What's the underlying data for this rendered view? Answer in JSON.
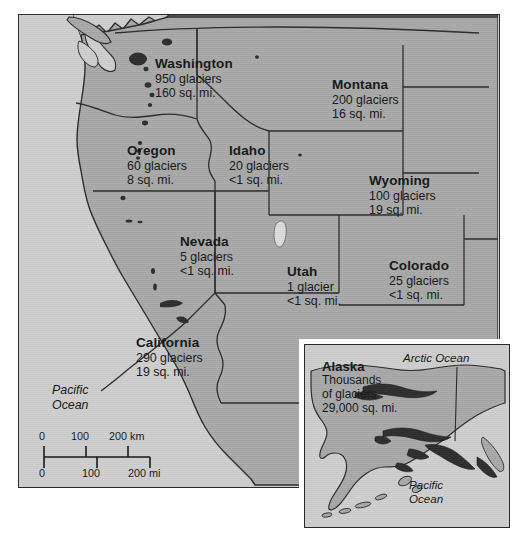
{
  "map": {
    "title": "Glaciers of the Western United States and Alaska",
    "colors": {
      "ocean": "#cfcfcf",
      "land": "#a9a9a9",
      "border": "#2b2b2b",
      "glacier": "#2e2e2e",
      "text": "#1a1a1a",
      "page": "#ffffff"
    },
    "states": [
      {
        "id": "washington",
        "name": "Washington",
        "glaciers_line": "950 glaciers",
        "area_line": "160 sq. mi.",
        "glacier_count": 950,
        "area_sq_mi": 160,
        "label_x": 136,
        "label_y": 41
      },
      {
        "id": "montana",
        "name": "Montana",
        "glaciers_line": "200 glaciers",
        "area_line": "16 sq. mi.",
        "glacier_count": 200,
        "area_sq_mi": 16,
        "label_x": 313,
        "label_y": 62
      },
      {
        "id": "oregon",
        "name": "Oregon",
        "glaciers_line": "60 glaciers",
        "area_line": "8 sq. mi.",
        "glacier_count": 60,
        "area_sq_mi": 8,
        "label_x": 108,
        "label_y": 128
      },
      {
        "id": "idaho",
        "name": "Idaho",
        "glaciers_line": "20 glaciers",
        "area_line": "<1 sq. mi.",
        "glacier_count": 20,
        "area_sq_mi": "<1",
        "label_x": 210,
        "label_y": 128
      },
      {
        "id": "wyoming",
        "name": "Wyoming",
        "glaciers_line": "100 glaciers",
        "area_line": "19 sq. mi.",
        "glacier_count": 100,
        "area_sq_mi": 19,
        "label_x": 350,
        "label_y": 158
      },
      {
        "id": "nevada",
        "name": "Nevada",
        "glaciers_line": "5 glaciers",
        "area_line": "<1 sq. mi.",
        "glacier_count": 5,
        "area_sq_mi": "<1",
        "label_x": 161,
        "label_y": 219
      },
      {
        "id": "utah",
        "name": "Utah",
        "glaciers_line": "1 glacier",
        "area_line": "<1 sq. mi.",
        "glacier_count": 1,
        "area_sq_mi": "<1",
        "label_x": 268,
        "label_y": 249
      },
      {
        "id": "colorado",
        "name": "Colorado",
        "glaciers_line": "25 glaciers",
        "area_line": "<1 sq. mi.",
        "glacier_count": 25,
        "area_sq_mi": "<1",
        "label_x": 370,
        "label_y": 243
      },
      {
        "id": "california",
        "name": "California",
        "glaciers_line": "290 glaciers",
        "area_line": "19 sq. mi.",
        "glacier_count": 290,
        "area_sq_mi": 19,
        "label_x": 117,
        "label_y": 320
      }
    ],
    "ocean_labels": [
      {
        "id": "pacific-main",
        "line1": "Pacific",
        "line2": "Ocean",
        "x": 33,
        "y": 368
      }
    ],
    "scale": {
      "km_labels": [
        "0",
        "100",
        "200 km"
      ],
      "mi_labels": [
        "0",
        "100",
        "200 mi"
      ],
      "km_tick_x": [
        0,
        42,
        84
      ],
      "mi_tick_x": [
        0,
        52,
        104
      ],
      "km_label_x": [
        0,
        36,
        74
      ],
      "mi_label_x": [
        0,
        46,
        94
      ]
    }
  },
  "inset": {
    "id": "alaska-inset",
    "state": {
      "id": "alaska",
      "name": "Alaska",
      "line1": "Thousands",
      "line2": "of glaciers",
      "line3": "29,000 sq. mi.",
      "glacier_count": "Thousands",
      "area_sq_mi": 29000,
      "label_x": 17,
      "label_y": 14
    },
    "ocean_labels": [
      {
        "id": "arctic-ocean",
        "line1": "Arctic Ocean",
        "line2": "",
        "x": 98,
        "y": 6
      },
      {
        "id": "pacific-inset",
        "line1": "Pacific",
        "line2": "Ocean",
        "x": 104,
        "y": 133
      }
    ]
  }
}
